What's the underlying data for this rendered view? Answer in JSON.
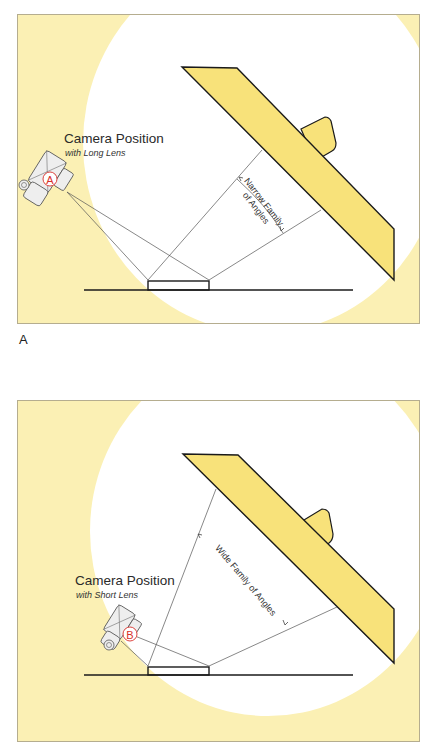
{
  "figure": {
    "panel_a": {
      "letter": "A",
      "camera_title": "Camera Position",
      "camera_subtitle": "with Long Lens",
      "camera_badge": "A",
      "angle_label_line1": "Narrow Family",
      "angle_label_line2": "of Angles"
    },
    "panel_b": {
      "camera_title": "Camera Position",
      "camera_subtitle": "with Short Lens",
      "camera_badge": "B",
      "angle_label": "Wide Family of Angles"
    },
    "colors": {
      "background_yellow": "#fbf0b4",
      "light_pool": "#ffffff",
      "reflector_fill": "#f8e27a",
      "outline": "#1a1a1a",
      "badge_red": "#d9302a"
    }
  }
}
